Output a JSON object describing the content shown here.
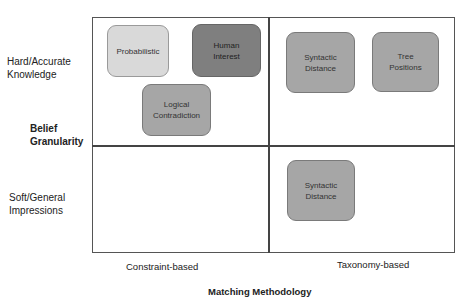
{
  "diagram": {
    "y_axis": {
      "title": "Belief Granularity",
      "title_lines": [
        "Belief",
        "Granularity"
      ],
      "top_label_lines": [
        "Hard/Accurate",
        "Knowledge"
      ],
      "bottom_label_lines": [
        "Soft/General",
        "Impressions"
      ]
    },
    "x_axis": {
      "title": "Matching Methodology",
      "left_label": "Constraint-based",
      "right_label": "Taxonomy-based"
    },
    "boxes": [
      {
        "lines": [
          "Probabilistic"
        ],
        "quadrant": "top-left",
        "color": "#d9d9d9"
      },
      {
        "lines": [
          "Human",
          "Interest"
        ],
        "quadrant": "top-left",
        "color": "#7f7f7f"
      },
      {
        "lines": [
          "Logical",
          "Contradiction"
        ],
        "quadrant": "top-left",
        "color": "#a6a6a6"
      },
      {
        "lines": [
          "Syntactic",
          "Distance"
        ],
        "quadrant": "top-right",
        "color": "#a6a6a6"
      },
      {
        "lines": [
          "Tree",
          "Positions"
        ],
        "quadrant": "top-right",
        "color": "#a6a6a6"
      },
      {
        "lines": [
          "Syntactic",
          "Distance"
        ],
        "quadrant": "bottom-right",
        "color": "#a6a6a6"
      }
    ]
  }
}
